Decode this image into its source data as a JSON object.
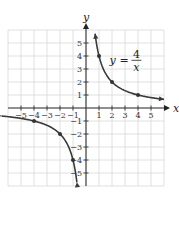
{
  "chart_data": {
    "type": "line",
    "title": "",
    "equation": {
      "lhs": "y",
      "eq": "=",
      "numerator": "4",
      "denominator": "x"
    },
    "xlabel": "x",
    "ylabel": "y",
    "xlim": [
      -6,
      6
    ],
    "ylim": [
      -6,
      6
    ],
    "grid": true,
    "x_ticks": [
      -5,
      -4,
      -3,
      -2,
      -1,
      1,
      2,
      3,
      4,
      5
    ],
    "y_ticks": [
      -5,
      -4,
      -3,
      -2,
      -1,
      1,
      2,
      3,
      4,
      5
    ],
    "x_tick_labels": [
      "−5",
      "−4",
      "−3",
      "−2",
      "−1",
      "1",
      "2",
      "3",
      "4",
      "5"
    ],
    "y_tick_labels": [
      "−5",
      "−4",
      "−3",
      "−2",
      "−1",
      "1",
      "2",
      "3",
      "4",
      "5"
    ],
    "series": [
      {
        "name": "y = 4/x (x > 0)",
        "function": "4/x",
        "domain": [
          0.7,
          6
        ],
        "marked_points": [
          [
            1,
            4
          ],
          [
            2,
            2
          ],
          [
            4,
            1
          ]
        ]
      },
      {
        "name": "y = 4/x (x < 0)",
        "function": "4/x",
        "domain": [
          -6.5,
          -0.7
        ],
        "marked_points": [
          [
            -1,
            -4
          ],
          [
            -2,
            -2
          ],
          [
            -4,
            -1
          ]
        ]
      }
    ]
  },
  "layout": {
    "origin_px": [
      86,
      108
    ],
    "unit_px": 13
  }
}
